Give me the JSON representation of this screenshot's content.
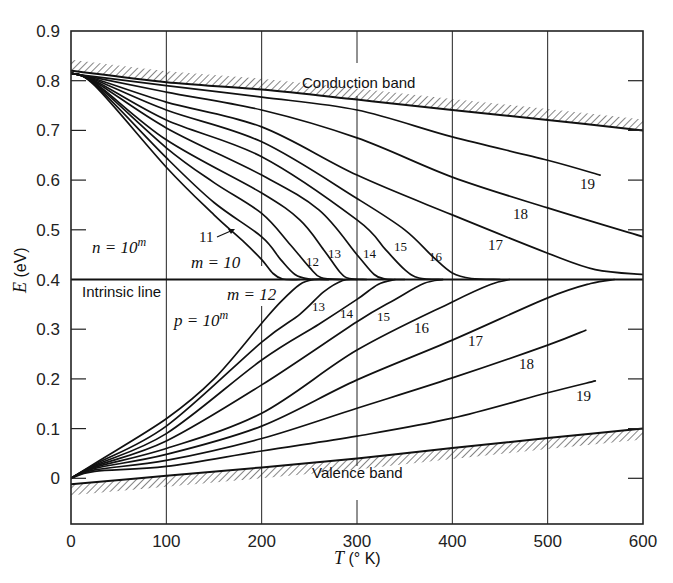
{
  "chart_data": {
    "type": "line",
    "title": "",
    "xlabel": "T (°K)",
    "ylabel": "E (eV)",
    "xlim": [
      0,
      600
    ],
    "ylim": [
      -0.09,
      0.9
    ],
    "xticks": [
      0,
      100,
      200,
      300,
      400,
      500,
      600
    ],
    "xtick_labels": [
      "0",
      "100",
      "200",
      "300",
      "400",
      "500",
      "600"
    ],
    "yticks": [
      0,
      0.1,
      0.2,
      0.3,
      0.4,
      0.5,
      0.6,
      0.7,
      0.8,
      0.9
    ],
    "ytick_labels": [
      "0",
      "0.1",
      "0.2",
      "0.3",
      "0.4",
      "0.5",
      "0.6",
      "0.7",
      "0.8",
      "0.9"
    ],
    "grid": "vertical lines at x ticks",
    "intrinsic_line": {
      "label": "Intrinsic line",
      "E": 0.4
    },
    "bands": [
      {
        "name": "Conduction band",
        "points": [
          [
            0,
            0.82
          ],
          [
            100,
            0.797
          ],
          [
            200,
            0.782
          ],
          [
            300,
            0.762
          ],
          [
            400,
            0.741
          ],
          [
            500,
            0.721
          ],
          [
            600,
            0.7
          ]
        ]
      },
      {
        "name": "Valence band",
        "points": [
          [
            0,
            -0.012
          ],
          [
            100,
            0.005
          ],
          [
            200,
            0.022
          ],
          [
            300,
            0.04
          ],
          [
            400,
            0.061
          ],
          [
            500,
            0.081
          ],
          [
            600,
            0.1
          ]
        ]
      }
    ],
    "annotations": {
      "n_family": "n = 10^m",
      "p_family": "p = 10^m",
      "n_start": "m = 10",
      "p_start": "m = 12"
    },
    "series": [
      {
        "name": "n m=10",
        "points": [
          [
            0,
            0.815
          ],
          [
            25,
            0.79
          ],
          [
            100,
            0.626
          ],
          [
            150,
            0.53
          ],
          [
            180,
            0.478
          ],
          [
            200,
            0.44
          ],
          [
            212,
            0.412
          ],
          [
            222,
            0.401
          ],
          [
            240,
            0.4
          ]
        ]
      },
      {
        "name": "n m=11",
        "points": [
          [
            0,
            0.815
          ],
          [
            25,
            0.792
          ],
          [
            100,
            0.645
          ],
          [
            150,
            0.555
          ],
          [
            200,
            0.486
          ],
          [
            220,
            0.44
          ],
          [
            235,
            0.41
          ],
          [
            250,
            0.401
          ],
          [
            270,
            0.4
          ]
        ]
      },
      {
        "name": "n m=12",
        "points": [
          [
            0,
            0.815
          ],
          [
            25,
            0.794
          ],
          [
            100,
            0.665
          ],
          [
            150,
            0.595
          ],
          [
            200,
            0.533
          ],
          [
            230,
            0.47
          ],
          [
            250,
            0.425
          ],
          [
            262,
            0.404
          ],
          [
            285,
            0.4
          ]
        ]
      },
      {
        "name": "n m=13",
        "points": [
          [
            0,
            0.815
          ],
          [
            25,
            0.796
          ],
          [
            100,
            0.681
          ],
          [
            200,
            0.574
          ],
          [
            240,
            0.52
          ],
          [
            265,
            0.46
          ],
          [
            282,
            0.415
          ],
          [
            292,
            0.402
          ],
          [
            310,
            0.4
          ]
        ]
      },
      {
        "name": "n m=14",
        "points": [
          [
            0,
            0.815
          ],
          [
            25,
            0.798
          ],
          [
            100,
            0.705
          ],
          [
            200,
            0.61
          ],
          [
            260,
            0.54
          ],
          [
            300,
            0.45
          ],
          [
            318,
            0.41
          ],
          [
            330,
            0.401
          ],
          [
            350,
            0.4
          ]
        ]
      },
      {
        "name": "n m=15",
        "points": [
          [
            0,
            0.815
          ],
          [
            25,
            0.8
          ],
          [
            100,
            0.721
          ],
          [
            200,
            0.647
          ],
          [
            300,
            0.52
          ],
          [
            330,
            0.46
          ],
          [
            350,
            0.42
          ],
          [
            365,
            0.403
          ],
          [
            390,
            0.4
          ]
        ]
      },
      {
        "name": "n m=16",
        "points": [
          [
            0,
            0.815
          ],
          [
            25,
            0.802
          ],
          [
            100,
            0.741
          ],
          [
            200,
            0.677
          ],
          [
            300,
            0.563
          ],
          [
            350,
            0.5
          ],
          [
            380,
            0.445
          ],
          [
            400,
            0.413
          ],
          [
            420,
            0.402
          ],
          [
            450,
            0.4
          ]
        ]
      },
      {
        "name": "n m=17",
        "points": [
          [
            0,
            0.815
          ],
          [
            25,
            0.804
          ],
          [
            100,
            0.757
          ],
          [
            200,
            0.707
          ],
          [
            300,
            0.61
          ],
          [
            400,
            0.53
          ],
          [
            500,
            0.453
          ],
          [
            550,
            0.42
          ],
          [
            600,
            0.41
          ]
        ]
      },
      {
        "name": "n m=18",
        "points": [
          [
            0,
            0.815
          ],
          [
            25,
            0.806
          ],
          [
            100,
            0.777
          ],
          [
            200,
            0.741
          ],
          [
            300,
            0.685
          ],
          [
            400,
            0.606
          ],
          [
            500,
            0.544
          ],
          [
            600,
            0.486
          ]
        ]
      },
      {
        "name": "n m=19",
        "points": [
          [
            0,
            0.815
          ],
          [
            25,
            0.808
          ],
          [
            100,
            0.79
          ],
          [
            200,
            0.767
          ],
          [
            300,
            0.741
          ],
          [
            400,
            0.687
          ],
          [
            500,
            0.64
          ],
          [
            555,
            0.61
          ]
        ]
      },
      {
        "name": "p m=12",
        "points": [
          [
            0,
            0.0
          ],
          [
            25,
            0.03
          ],
          [
            100,
            0.12
          ],
          [
            150,
            0.2
          ],
          [
            200,
            0.312
          ],
          [
            220,
            0.355
          ],
          [
            240,
            0.39
          ],
          [
            255,
            0.4
          ],
          [
            270,
            0.4
          ]
        ]
      },
      {
        "name": "p m=13",
        "points": [
          [
            0,
            0.0
          ],
          [
            25,
            0.028
          ],
          [
            100,
            0.105
          ],
          [
            200,
            0.274
          ],
          [
            240,
            0.33
          ],
          [
            265,
            0.375
          ],
          [
            285,
            0.398
          ],
          [
            300,
            0.4
          ]
        ]
      },
      {
        "name": "p m=14",
        "points": [
          [
            0,
            0.0
          ],
          [
            25,
            0.026
          ],
          [
            100,
            0.09
          ],
          [
            200,
            0.238
          ],
          [
            260,
            0.31
          ],
          [
            300,
            0.36
          ],
          [
            322,
            0.39
          ],
          [
            340,
            0.4
          ]
        ]
      },
      {
        "name": "p m=15",
        "points": [
          [
            0,
            0.0
          ],
          [
            25,
            0.024
          ],
          [
            100,
            0.075
          ],
          [
            200,
            0.188
          ],
          [
            300,
            0.315
          ],
          [
            340,
            0.36
          ],
          [
            370,
            0.392
          ],
          [
            390,
            0.4
          ]
        ]
      },
      {
        "name": "p m=16",
        "points": [
          [
            0,
            0.0
          ],
          [
            25,
            0.022
          ],
          [
            100,
            0.06
          ],
          [
            200,
            0.131
          ],
          [
            300,
            0.258
          ],
          [
            400,
            0.355
          ],
          [
            440,
            0.39
          ],
          [
            460,
            0.4
          ]
        ]
      },
      {
        "name": "p m=17",
        "points": [
          [
            0,
            0.0
          ],
          [
            25,
            0.02
          ],
          [
            100,
            0.048
          ],
          [
            200,
            0.105
          ],
          [
            300,
            0.198
          ],
          [
            400,
            0.278
          ],
          [
            500,
            0.363
          ],
          [
            545,
            0.392
          ],
          [
            570,
            0.4
          ]
        ]
      },
      {
        "name": "p m=18",
        "points": [
          [
            0,
            0.0
          ],
          [
            25,
            0.017
          ],
          [
            100,
            0.036
          ],
          [
            200,
            0.08
          ],
          [
            300,
            0.141
          ],
          [
            400,
            0.202
          ],
          [
            500,
            0.268
          ],
          [
            540,
            0.298
          ]
        ]
      },
      {
        "name": "p m=19",
        "points": [
          [
            0,
            0.0
          ],
          [
            25,
            0.014
          ],
          [
            100,
            0.024
          ],
          [
            200,
            0.055
          ],
          [
            300,
            0.085
          ],
          [
            400,
            0.121
          ],
          [
            500,
            0.172
          ],
          [
            550,
            0.196
          ]
        ]
      }
    ],
    "curve_labels": [
      {
        "text": "11",
        "x": 199,
        "y": 242,
        "arrow": true
      },
      {
        "text": "12",
        "x": 306,
        "y": 266,
        "small": true
      },
      {
        "text": "13",
        "x": 328,
        "y": 258,
        "small": true
      },
      {
        "text": "14",
        "x": 363,
        "y": 258,
        "small": true
      },
      {
        "text": "15",
        "x": 394,
        "y": 251,
        "small": true
      },
      {
        "text": "16",
        "x": 429,
        "y": 261,
        "small": true
      },
      {
        "text": "17",
        "x": 488,
        "y": 250
      },
      {
        "text": "18",
        "x": 513,
        "y": 219
      },
      {
        "text": "19",
        "x": 580,
        "y": 189
      },
      {
        "text": "13",
        "x": 312,
        "y": 311,
        "small": true
      },
      {
        "text": "14",
        "x": 340,
        "y": 318,
        "small": true
      },
      {
        "text": "15",
        "x": 377,
        "y": 321,
        "small": true
      },
      {
        "text": "16",
        "x": 414,
        "y": 333
      },
      {
        "text": "17",
        "x": 468,
        "y": 346
      },
      {
        "text": "18",
        "x": 519,
        "y": 369
      },
      {
        "text": "19",
        "x": 576,
        "y": 401
      }
    ]
  },
  "labels": {
    "conduction_band": "Conduction band",
    "valence_band": "Valence band",
    "intrinsic_line": "Intrinsic line",
    "n_eq": "n = 10",
    "p_eq": "p = 10",
    "sup_m": "m",
    "m10": "m = 10",
    "m12": "m = 12",
    "ylabel_sym": "E",
    "ylabel_unit": " (eV)",
    "xlabel_sym": "T",
    "xlabel_unit": " (° K)"
  }
}
